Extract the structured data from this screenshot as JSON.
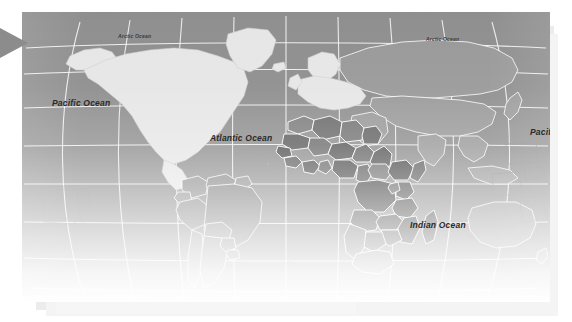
{
  "map": {
    "name": "world-map",
    "projection": "robinson",
    "style": "grayscale-choropleth",
    "graticule_visible": true,
    "colors": {
      "ocean": "#8f8f8f",
      "land_pale": "#e8e8e8",
      "land_mid": "#9a9a9a",
      "land_highlight_dark": "#5e5e5e",
      "land_highlight_mid": "#7a7a7a",
      "border": "#ffffff",
      "coastline": "#6f6f6f",
      "label_text": "#2b2b2b",
      "marker": "#8c8c8c",
      "page_background": "#ffffff"
    },
    "labels": [
      {
        "id": "arctic-ocean-west",
        "text": "Arctic Ocean"
      },
      {
        "id": "arctic-ocean-east",
        "text": "Arctic Ocean"
      },
      {
        "id": "pacific-ocean-west",
        "text": "Pacific Ocean"
      },
      {
        "id": "atlantic-ocean",
        "text": "Atlantic Ocean"
      },
      {
        "id": "indian-ocean",
        "text": "Indian Ocean"
      },
      {
        "id": "pacific-ocean-east",
        "text": "Pacific Ocean"
      }
    ],
    "marker": {
      "id": "left-edge-pointer",
      "shape": "triangle-right"
    }
  }
}
